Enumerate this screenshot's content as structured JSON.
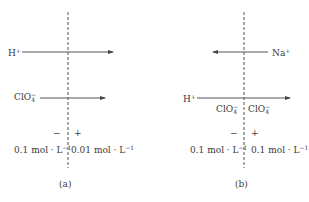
{
  "panels": [
    {
      "caption": "(a)",
      "arrows": [
        {
          "ion": "H",
          "charge": "+",
          "direction": "right"
        },
        {
          "ion": "ClO",
          "subscript": "4",
          "charge": "−",
          "direction": "right"
        }
      ],
      "membrane_labels": [],
      "polarity": {
        "left": "−",
        "right": "+"
      },
      "concentration": {
        "left": "0.1 mol · L",
        "right": "0.01 mol · L",
        "exponent": "−1"
      }
    },
    {
      "caption": "(b)",
      "arrows": [
        {
          "ion": "Na",
          "charge": "+",
          "direction": "left"
        },
        {
          "ion": "H",
          "charge": "+",
          "direction": "right"
        }
      ],
      "membrane_labels": [
        {
          "ion": "ClO",
          "subscript": "4",
          "charge": "−"
        },
        {
          "ion": "ClO",
          "subscript": "4",
          "charge": "−"
        }
      ],
      "polarity": {
        "left": "−",
        "right": "+"
      },
      "concentration": {
        "left": "0.1 mol · L",
        "right": "0.1 mol · L",
        "exponent": "−1"
      }
    }
  ],
  "colors": {
    "line": "#4a4a4a",
    "text": "#3a3a3a",
    "background": "#ffffff"
  }
}
